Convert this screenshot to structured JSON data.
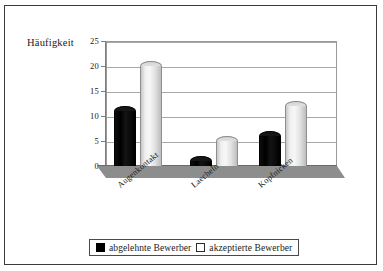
{
  "chart_data": {
    "type": "bar",
    "title": "",
    "xlabel": "",
    "ylabel": "Häufigkeit",
    "categories": [
      "Augenkontakt",
      "Laecheln",
      "Kopfnicken"
    ],
    "series": [
      {
        "name": "abgelehnte Bewerber",
        "values": [
          12,
          2,
          7
        ],
        "color": "#000000"
      },
      {
        "name": "akzeptierte Bewerber",
        "values": [
          21,
          6,
          13
        ],
        "color": "#ffffff"
      }
    ],
    "ylim": [
      0,
      25
    ],
    "yticks": [
      0,
      5,
      10,
      15,
      20,
      25
    ],
    "ytick_labels": [
      "0",
      "5",
      "10",
      "15",
      "20",
      "25"
    ],
    "grid": true,
    "legend_position": "bottom",
    "style": "3d-cylinder"
  },
  "axis": {
    "y_title": "Häufigkeit"
  },
  "legend": {
    "items": [
      {
        "label": "abgelehnte Bewerber",
        "swatch": "filled-black-square"
      },
      {
        "label": "akzeptierte Bewerber",
        "swatch": "outlined-white-square"
      }
    ]
  }
}
